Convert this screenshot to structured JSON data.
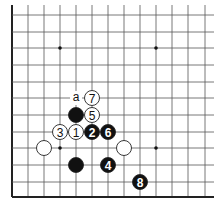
{
  "diagram": {
    "type": "go-board-corner",
    "corner": "bottom-left",
    "grid": {
      "columns_x": [
        12,
        28,
        44,
        60,
        76,
        92,
        108,
        124,
        140,
        156,
        172,
        188,
        205
      ],
      "rows_y": [
        15,
        32,
        48,
        65,
        82,
        98,
        115,
        132,
        148,
        165,
        182,
        197
      ],
      "top_extend": 5,
      "right_extend": 214,
      "line_color": "#555555",
      "edge_color": "#222222"
    },
    "star_points": [
      {
        "col": 3,
        "row": 2
      },
      {
        "col": 9,
        "row": 2
      },
      {
        "col": 3,
        "row": 8
      },
      {
        "col": 9,
        "row": 8
      }
    ],
    "stones": [
      {
        "color": "white",
        "col": 5,
        "row": 5,
        "label": "7"
      },
      {
        "color": "black",
        "col": 4,
        "row": 6,
        "label": ""
      },
      {
        "color": "white",
        "col": 5,
        "row": 6,
        "label": "5"
      },
      {
        "color": "white",
        "col": 3,
        "row": 7,
        "label": "3"
      },
      {
        "color": "white",
        "col": 4,
        "row": 7,
        "label": "1"
      },
      {
        "color": "black",
        "col": 5,
        "row": 7,
        "label": "2"
      },
      {
        "color": "black",
        "col": 6,
        "row": 7,
        "label": "6"
      },
      {
        "color": "white",
        "col": 2,
        "row": 8,
        "label": ""
      },
      {
        "color": "white",
        "col": 7,
        "row": 8,
        "label": ""
      },
      {
        "color": "black",
        "col": 4,
        "row": 9,
        "label": ""
      },
      {
        "color": "black",
        "col": 6,
        "row": 9,
        "label": "4"
      },
      {
        "color": "black",
        "col": 8,
        "row": 10,
        "label": "8"
      }
    ],
    "markers": [
      {
        "type": "letter",
        "text": "a",
        "col": 4,
        "row": 5
      }
    ],
    "colors": {
      "black_stone": "#111111",
      "white_stone": "#ffffff",
      "stone_outline": "#222222"
    }
  }
}
